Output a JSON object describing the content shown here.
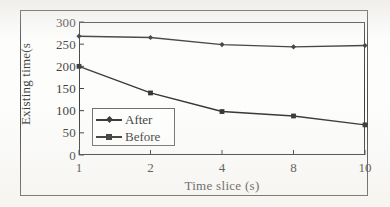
{
  "figure": {
    "frame_color": "#2c2c2c",
    "axis_color": "#1a1a1a",
    "series_color": "#101010",
    "background": "#fdfdfc"
  },
  "legend": {
    "position": "inside-lower-left",
    "entries": [
      {
        "label": "After",
        "marker": "diamond"
      },
      {
        "label": "Before",
        "marker": "square"
      }
    ]
  },
  "chart_data": {
    "type": "line",
    "title": "",
    "xlabel": "Time slice (s)",
    "ylabel": "Existing time(s",
    "categories": [
      "1",
      "2",
      "4",
      "8",
      "10"
    ],
    "x_tick_labels": [
      "1",
      "2",
      "4",
      "8",
      "10"
    ],
    "y_tick_labels": [
      "0",
      "50",
      "100",
      "150",
      "200",
      "250",
      "300"
    ],
    "y_ticks": [
      0,
      50,
      100,
      150,
      200,
      250,
      300
    ],
    "ylim": [
      0,
      300
    ],
    "grid": false,
    "legend_position": "inside-lower-left",
    "series": [
      {
        "name": "After",
        "marker": "diamond",
        "values": [
          268,
          265,
          249,
          244,
          247
        ]
      },
      {
        "name": "Before",
        "marker": "square",
        "values": [
          200,
          140,
          98,
          88,
          68
        ]
      }
    ]
  }
}
